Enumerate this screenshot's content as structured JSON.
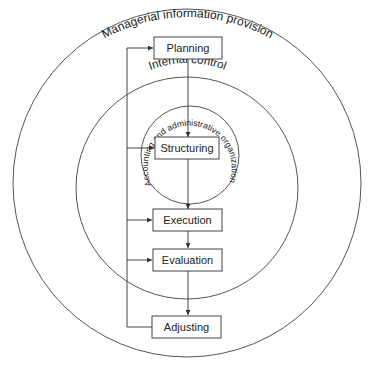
{
  "diagram": {
    "rings": {
      "outer": {
        "label": "Managerial information provision"
      },
      "middle": {
        "label": "Internal control"
      },
      "inner": {
        "label": "Accounting and administrative organization"
      }
    },
    "steps": [
      {
        "id": "planning",
        "label": "Planning"
      },
      {
        "id": "structuring",
        "label": "Structuring"
      },
      {
        "id": "execution",
        "label": "Execution"
      },
      {
        "id": "evaluation",
        "label": "Evaluation"
      },
      {
        "id": "adjusting",
        "label": "Adjusting"
      }
    ],
    "colors": {
      "line": "#444444",
      "text": "#222222",
      "background": "#ffffff"
    }
  }
}
